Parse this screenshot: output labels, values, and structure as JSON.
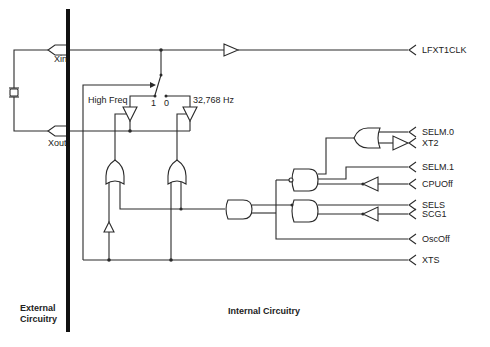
{
  "diagram": {
    "type": "circuit-schematic",
    "regions": {
      "external": "External Circuitry",
      "internal": "Internal Circuitry"
    },
    "pins": {
      "xin": "Xin",
      "xout": "Xout"
    },
    "switch": {
      "label_high": "High Freq",
      "pos_1": "1",
      "pos_0": "0",
      "label_low": "32,768 Hz"
    },
    "signals": [
      {
        "name": "LFXT1CLK",
        "direction": "output"
      },
      {
        "name": "SELM.0",
        "direction": "input"
      },
      {
        "name": "XT2",
        "direction": "input"
      },
      {
        "name": "SELM.1",
        "direction": "input"
      },
      {
        "name": "CPUOff",
        "direction": "input"
      },
      {
        "name": "SELS",
        "direction": "input"
      },
      {
        "name": "SCG1",
        "direction": "input"
      },
      {
        "name": "OscOff",
        "direction": "input"
      },
      {
        "name": "XTS",
        "direction": "input"
      }
    ],
    "components": [
      "crystal",
      "buffer",
      "switch",
      "tristate-buffer-high-freq",
      "tristate-buffer-32768hz",
      "or-gate",
      "or-gate",
      "inverter",
      "and-gate",
      "nand-gate",
      "and-gate",
      "or-gate",
      "inverter-xt2",
      "inverter-cpuoff",
      "inverter-scg1"
    ]
  }
}
